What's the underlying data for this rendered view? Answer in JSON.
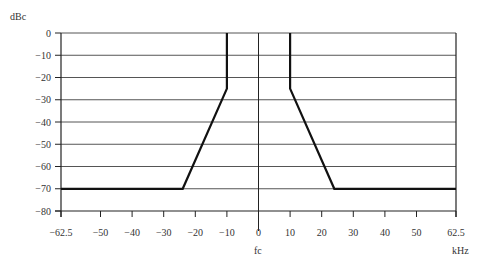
{
  "chart_data": {
    "type": "line",
    "title": "",
    "ylabel": "dBc",
    "xlabel": "kHz",
    "center_label": "fc",
    "xlim": [
      -62.5,
      62.5
    ],
    "ylim": [
      -80,
      0
    ],
    "x_ticks": [
      -62.5,
      -50,
      -40,
      -30,
      -20,
      -10,
      0,
      10,
      20,
      30,
      40,
      50,
      62.5
    ],
    "x_tick_labels": [
      "−62.5",
      "−50",
      "−40",
      "−30",
      "−20",
      "−10",
      "0",
      "10",
      "20",
      "30",
      "40",
      "50",
      "62.5"
    ],
    "y_ticks": [
      0,
      -10,
      -20,
      -30,
      -40,
      -50,
      -60,
      -70,
      -80
    ],
    "y_tick_labels": [
      "0",
      "−10",
      "−20",
      "−30",
      "−40",
      "−50",
      "−60",
      "−70",
      "−80"
    ],
    "grid": {
      "horizontal": true,
      "vertical": false
    },
    "legend": null,
    "series": [
      {
        "name": "spectrum-mask",
        "color": "#111111",
        "x": [
          -62.5,
          -24,
          -10,
          -10,
          null,
          10,
          10,
          24,
          62.5
        ],
        "y": [
          -70,
          -70,
          -25,
          0,
          null,
          0,
          -25,
          -70,
          -70
        ]
      }
    ]
  }
}
